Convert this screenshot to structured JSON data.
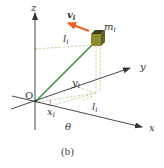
{
  "figure": {
    "caption": "(b)",
    "origin_label": "O",
    "axes": {
      "x": "x",
      "y": "y",
      "z": "z"
    },
    "mass": {
      "symbol": "m",
      "subscript": "i",
      "color_top": "#3c3f1c",
      "color_front": "#8c8c2e",
      "color_side": "#5e6222"
    },
    "velocity": {
      "symbol": "v",
      "subscript": "i",
      "color": "#e8622a"
    },
    "position_vector_color": "#3a9a3a",
    "dashed_color": "#c8d6a8",
    "labels": {
      "l_upper": {
        "symbol": "l",
        "subscript": "i"
      },
      "l_lower": {
        "symbol": "l",
        "subscript": "i"
      },
      "y_coord": {
        "symbol": "y",
        "subscript": "i"
      },
      "x_coord": {
        "symbol": "x",
        "subscript": "i"
      },
      "angle": "θ"
    }
  }
}
